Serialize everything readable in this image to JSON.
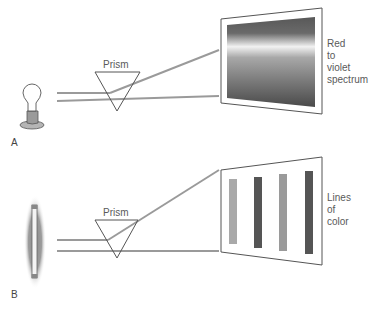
{
  "panel_a": {
    "label": "A",
    "prism_label": "Prism",
    "screen_caption": [
      "Red",
      "to",
      "violet",
      "spectrum"
    ],
    "light_source": "incandescent-bulb",
    "screen_type": "continuous-spectrum"
  },
  "panel_b": {
    "label": "B",
    "prism_label": "Prism",
    "screen_caption": [
      "Lines",
      "of",
      "color"
    ],
    "light_source": "fluorescent-tube",
    "screen_type": "line-spectrum",
    "lines": [
      {
        "color": "#a9a9a9"
      },
      {
        "color": "#555555"
      },
      {
        "color": "#9a9a9a"
      },
      {
        "color": "#555555"
      }
    ]
  },
  "colors": {
    "beam": "#9a9a9a",
    "outline": "#555555",
    "text": "#5a5a5a"
  }
}
